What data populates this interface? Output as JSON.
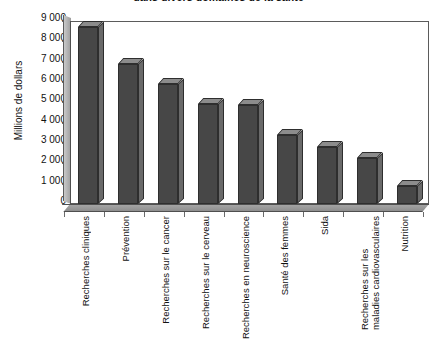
{
  "chart_data": {
    "type": "bar",
    "title": "dans divers domaines de la santé",
    "xlabel": "",
    "ylabel": "Millions de dollars",
    "ylim": [
      0,
      9000
    ],
    "ytick_labels": [
      "9 000",
      "8 000",
      "7 000",
      "6 000",
      "5 000",
      "4 000",
      "3 000",
      "2 000",
      "1 000",
      "0"
    ],
    "ytick_values": [
      9000,
      8000,
      7000,
      6000,
      5000,
      4000,
      3000,
      2000,
      1000,
      0
    ],
    "grid": false,
    "legend": "none",
    "style": "3d-column",
    "categories": [
      "Recherches cliniques",
      "Prévention",
      "Recherches sur le cancer",
      "Recherches sur le cerveau",
      "Recherches en neuroscience",
      "Santé des femmes",
      "Sida",
      "Recherches sur les\nmaladies cardiovasculaires",
      "Nutrition"
    ],
    "values": [
      8700,
      6900,
      5900,
      4900,
      4850,
      3400,
      2800,
      2250,
      900
    ],
    "colors": {
      "bar_front": "#474747",
      "bar_top": "#8c8c8c",
      "bar_side": "#6a6a6a",
      "bar_outline": "#2e2e2e",
      "plot_background": "#ffffff",
      "axis": "#4f4f4f",
      "text": "#111111"
    }
  }
}
